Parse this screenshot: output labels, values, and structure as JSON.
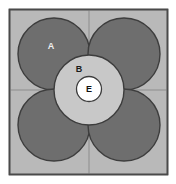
{
  "figure": {
    "title": "",
    "canvas": {
      "width": 176,
      "height": 184,
      "background": "#ffffff"
    },
    "square": {
      "name": "unit-cell-square",
      "x": 9.5,
      "y": 9.5,
      "width": 158,
      "height": 165,
      "fill": "#b9b9b9",
      "stroke": "#4a4a4a",
      "stroke_width": 1.6
    },
    "axes": {
      "vertical_x": 89,
      "horizontal_y": 90,
      "stroke": "#8d8d8d",
      "stroke_width": 1
    },
    "corner_circles": {
      "fill": "#6e6e6e",
      "stroke": "#3d3d3d",
      "stroke_width": 1.4,
      "radius": 36,
      "centers": [
        {
          "label": "top-left",
          "cx": 54,
          "cy": 54
        },
        {
          "label": "top-right",
          "cx": 124,
          "cy": 54
        },
        {
          "label": "bottom-left",
          "cx": 54,
          "cy": 125
        },
        {
          "label": "bottom-right",
          "cx": 124,
          "cy": 125
        }
      ]
    },
    "middle_circle": {
      "name": "circle-b",
      "cx": 89,
      "cy": 90,
      "r": 35,
      "fill": "#c8c8c8",
      "stroke": "#3d3d3d",
      "stroke_width": 1.4
    },
    "inner_circle": {
      "name": "circle-e",
      "cx": 89,
      "cy": 89,
      "r": 12.5,
      "fill": "#ffffff",
      "stroke": "#3d3d3d",
      "stroke_width": 1.3
    },
    "labels": [
      {
        "id": "a",
        "text": "A",
        "x": 51,
        "y": 49,
        "color": "#efefef",
        "size": 9,
        "weight": "bold"
      },
      {
        "id": "b",
        "text": "B",
        "x": 79,
        "y": 72,
        "color": "#1a1a1a",
        "size": 9,
        "weight": "bold"
      },
      {
        "id": "e",
        "text": "E",
        "x": 89,
        "y": 92,
        "color": "#111111",
        "size": 9,
        "weight": "bold"
      }
    ]
  }
}
